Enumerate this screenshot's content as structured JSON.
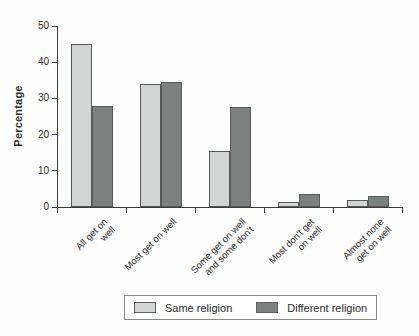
{
  "chart_data": {
    "type": "bar",
    "title": "",
    "ylabel": "Percentage",
    "xlabel": "",
    "categories": [
      "All get on well",
      "Most get on well",
      "Some get on well\nand some don't",
      "Most don't get\non well",
      "Almost none\nget on well"
    ],
    "series": [
      {
        "name": "Same religion",
        "color": "#d3d5d4",
        "values": [
          45,
          34,
          15.5,
          1.5,
          2
        ]
      },
      {
        "name": "Different religion",
        "color": "#7c807f",
        "values": [
          28,
          34.5,
          27.5,
          3.5,
          3
        ]
      }
    ],
    "ylim": [
      0,
      50
    ],
    "yticks": [
      0,
      10,
      20,
      30,
      40,
      50
    ],
    "grid": "off",
    "legend_position": "bottom"
  },
  "colors": {
    "axis": "#3a3a3a",
    "bar_border": "#565a59",
    "legend_border": "#8a8a8a",
    "text": "#2b2b2b"
  }
}
